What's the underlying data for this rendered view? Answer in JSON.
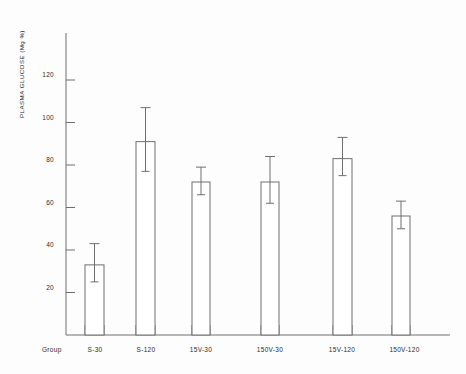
{
  "chart_data": {
    "type": "bar",
    "title": "",
    "xlabel": "Group",
    "ylabel": "PLASMA GLUCOSE (Mg %)",
    "categories": [
      "S-30",
      "S-120",
      "15V-30",
      "150V-30",
      "15V-120",
      "150V-120"
    ],
    "values": [
      33,
      91,
      72,
      72,
      83,
      56
    ],
    "errors_upper": [
      43,
      107,
      79,
      84,
      93,
      63
    ],
    "errors_lower": [
      25,
      77,
      66,
      62,
      75,
      50
    ],
    "ylim": [
      0,
      133
    ],
    "yticks": [
      20,
      40,
      60,
      80,
      100,
      120
    ],
    "ytick_labels": [
      "20",
      "40",
      "60",
      "80",
      "100",
      "120"
    ],
    "grid": false,
    "legend": null,
    "bar_fill": "#ffffff",
    "bar_stroke": "#6e6e6e",
    "axis_color": "#6e6e6e",
    "text_color": "#2b2b2b"
  },
  "axes": {
    "y_title": "PLASMA GLUCOSE (Mg %)",
    "x_group_label": "Group"
  }
}
